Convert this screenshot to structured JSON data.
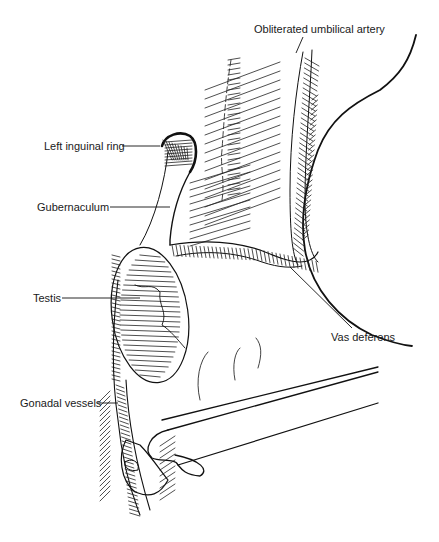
{
  "figure": {
    "labels": {
      "obliterated_umbilical_artery": "Obliterated umbilical artery",
      "left_inguinal_ring": "Left inguinal ring",
      "gubernaculum": "Gubernaculum",
      "testis": "Testis",
      "vas_deferens": "Vas deferens",
      "gonadal_vessels": "Gonadal vessels"
    },
    "colors": {
      "ink": "#111111",
      "background": "#ffffff"
    }
  }
}
